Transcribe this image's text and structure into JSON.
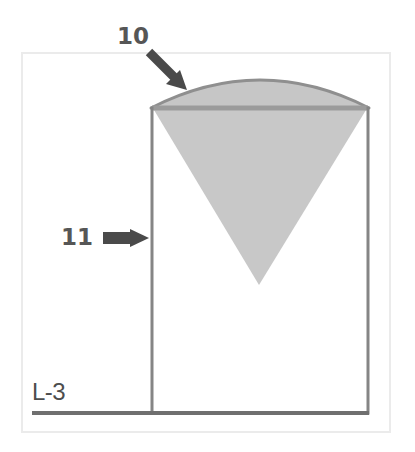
{
  "figure": {
    "background_color": "#ffffff",
    "outer_frame": {
      "name": "drawing-border",
      "x": 21,
      "y": 52,
      "width": 369,
      "height": 380,
      "stroke_color": "#e9e9e9",
      "stroke_width": 2
    },
    "labels": [
      {
        "id": "10",
        "text": "10",
        "color": "#565656",
        "x": 117,
        "y": 25,
        "points_to": "dome-top"
      },
      {
        "id": "11",
        "text": "11",
        "color": "#565656",
        "x": 61,
        "y": 226,
        "points_to": "vessel-wall"
      },
      {
        "id": "L-3",
        "text": "L-3",
        "color": "#4d4d4d",
        "x": 32,
        "y": 380,
        "points_to": "baseline"
      }
    ],
    "leader_arrows": [
      {
        "name": "arrow-to-dome",
        "type": "diagonal",
        "from_x": 147,
        "from_y": 50,
        "to_x": 184,
        "to_y": 87,
        "color": "#4a4a4a"
      },
      {
        "name": "arrow-to-wall",
        "type": "horizontal",
        "from_x": 103,
        "from_y": 238,
        "to_x": 149,
        "to_y": 238,
        "color": "#4a4a4a"
      }
    ],
    "shapes": {
      "vessel_body": {
        "name": "vessel-body-rectangle",
        "left": 151,
        "right": 369,
        "top": 107,
        "bottom": 414,
        "stroke_color": "#808080",
        "stroke_width": 3,
        "fill": "none"
      },
      "dome": {
        "name": "vessel-dome",
        "left": 151,
        "right": 369,
        "base_y": 107,
        "apex_y": 68,
        "fill_color": "#c6c6c6",
        "stroke_color": "#8e8e8e",
        "stroke_width": 3
      },
      "dome_base_band": {
        "name": "dome-base-band",
        "y": 107,
        "color": "#9b9b9b",
        "thickness": 4
      },
      "cone": {
        "name": "inverted-cone-fill",
        "left_x": 155,
        "right_x": 365,
        "top_y": 110,
        "apex_x": 259,
        "apex_y": 285,
        "fill_color": "#c8c8c8"
      },
      "baseline": {
        "name": "baseline-l3",
        "x1": 32,
        "x2": 369,
        "y": 413,
        "color": "#6f6f6f",
        "thickness": 4
      }
    }
  }
}
